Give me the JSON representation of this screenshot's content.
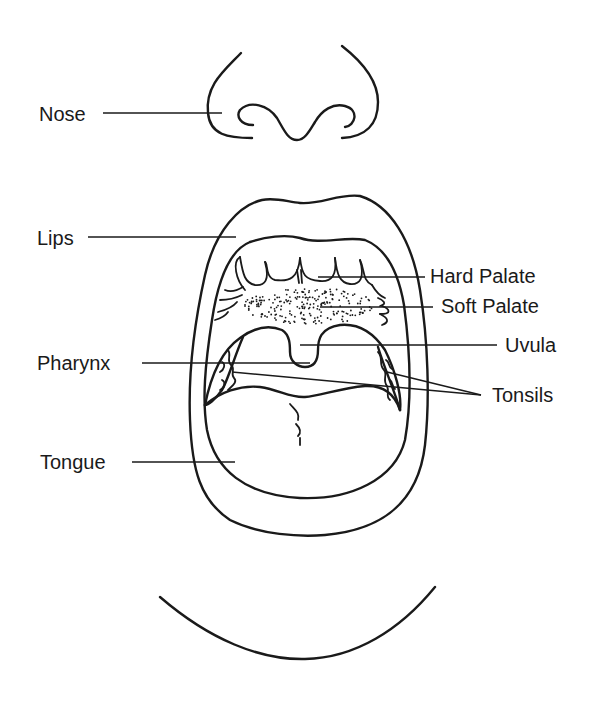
{
  "labels": {
    "nose": "Nose",
    "lips": "Lips",
    "hard_palate": "Hard Palate",
    "soft_palate": "Soft Palate",
    "uvula": "Uvula",
    "pharynx": "Pharynx",
    "tonsils": "Tonsils",
    "tongue": "Tongue"
  },
  "colors": {
    "ink": "#1a1a1a",
    "background": "#ffffff"
  }
}
